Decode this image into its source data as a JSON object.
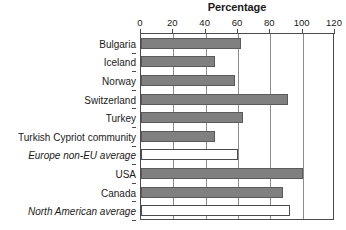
{
  "chart_data": {
    "type": "bar",
    "orientation": "horizontal",
    "title": "Percentage",
    "xlabel": "",
    "ylabel": "",
    "xlim": [
      0,
      120
    ],
    "xticks": [
      0,
      20,
      40,
      60,
      80,
      100,
      120
    ],
    "grid": true,
    "legend": "none",
    "categories": [
      "Bulgaria",
      "Iceland",
      "Norway",
      "Switzerland",
      "Turkey",
      "Turkish Cypriot community",
      "Europe non-EU average",
      "USA",
      "Canada",
      "North American average"
    ],
    "values": [
      62,
      46,
      58,
      91,
      63,
      46,
      60,
      100,
      88,
      92
    ],
    "styles": [
      "filled",
      "filled",
      "filled",
      "filled",
      "filled",
      "filled",
      "hollow",
      "filled",
      "filled",
      "hollow"
    ],
    "italic_categories": [
      "Europe non-EU average",
      "North American average"
    ],
    "colors": {
      "bar_fill": "#808080",
      "bar_stroke": "#5a5a5a",
      "hollow_fill": "#ffffff",
      "hollow_stroke": "#4c4c4c",
      "gridline": "#8c8c8c",
      "axis": "#4c4c4c",
      "text": "#1a1a1a",
      "background": "#ffffff"
    }
  }
}
